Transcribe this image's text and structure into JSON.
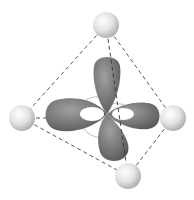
{
  "diagram": {
    "colors": {
      "lobe": "#6e6e6e",
      "lobe_highlight": "#9a9a9a",
      "ligand": "#dcdcdc",
      "ligand_highlight": "#ffffff",
      "edge": "#444444",
      "background": "#ffffff"
    },
    "ligands": [
      {
        "name": "top",
        "cx": 106,
        "cy": 25,
        "r": 13
      },
      {
        "name": "left",
        "cx": 22,
        "cy": 118,
        "r": 13
      },
      {
        "name": "right",
        "cx": 173,
        "cy": 118,
        "r": 13
      },
      {
        "name": "bottom",
        "cx": 128,
        "cy": 176,
        "r": 13
      }
    ]
  }
}
